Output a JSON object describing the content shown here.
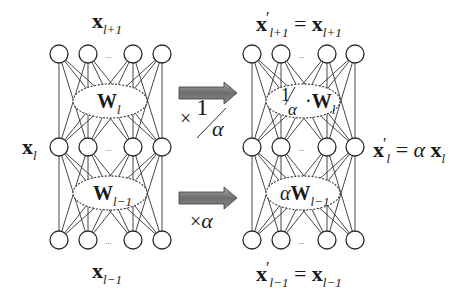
{
  "diagram": {
    "left_network": {
      "top_label": {
        "var": "x",
        "sub": "l+1"
      },
      "mid_label": {
        "var": "x",
        "sub": "l"
      },
      "bottom_label": {
        "var": "x",
        "sub": "l−1"
      },
      "weight_upper": {
        "var": "W",
        "sub": "l"
      },
      "weight_lower": {
        "var": "W",
        "sub": "l−1"
      },
      "ellipsis": "···"
    },
    "right_network": {
      "top_label": {
        "lhs_var": "x",
        "lhs_prime": "′",
        "lhs_sub": "l+1",
        "eq": "=",
        "rhs_var": "x",
        "rhs_sub": "l+1"
      },
      "mid_label": {
        "lhs_var": "x",
        "lhs_prime": "′",
        "lhs_sub": "l",
        "eq": "=",
        "coef": "α",
        "rhs_var": "x",
        "rhs_sub": "l"
      },
      "bottom_label": {
        "lhs_var": "x",
        "lhs_prime": "′",
        "lhs_sub": "l−1",
        "eq": "=",
        "rhs_var": "x",
        "rhs_sub": "l−1"
      },
      "weight_upper": {
        "frac_num": "1",
        "frac_den": "α",
        "dot": "·",
        "var": "W",
        "sub": "l"
      },
      "weight_lower": {
        "coef": "α",
        "var": "W",
        "sub": "l−1"
      },
      "ellipsis": "···"
    },
    "arrows": {
      "upper": {
        "times": "×",
        "num": "1",
        "den": "α",
        "color": "#7a7a7a"
      },
      "lower": {
        "times": "×",
        "factor": "α",
        "color": "#7a7a7a"
      }
    },
    "colors": {
      "stroke": "#2a2a2a",
      "node_fill": "#ffffff",
      "arrow_fill": "#7d7d7d",
      "arrow_stroke": "#3a3a3a"
    }
  }
}
